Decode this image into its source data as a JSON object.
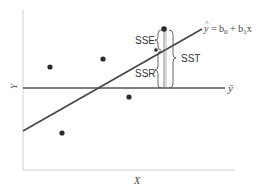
{
  "diagram": {
    "axes": {
      "x_label": "X",
      "y_label": "Y"
    },
    "lines": {
      "regression": {
        "label_hat": "^",
        "label_y": "y",
        "label_rest": " = b",
        "sub0": "0",
        "plus": " + b",
        "sub1": "1",
        "x": "x"
      },
      "mean": {
        "label": "ȳ"
      }
    },
    "braces": {
      "sse": "SSE",
      "ssr": "SSR",
      "sst": "SST"
    },
    "points": [
      {
        "x": 50,
        "y": 67
      },
      {
        "x": 103,
        "y": 59
      },
      {
        "x": 129,
        "y": 97
      },
      {
        "x": 62,
        "y": 133
      },
      {
        "x": 156,
        "y": 50
      },
      {
        "x": 164,
        "y": 29
      }
    ],
    "colors": {
      "line": "#444444",
      "axis": "#cccccc",
      "point": "#2a2a2a"
    }
  }
}
